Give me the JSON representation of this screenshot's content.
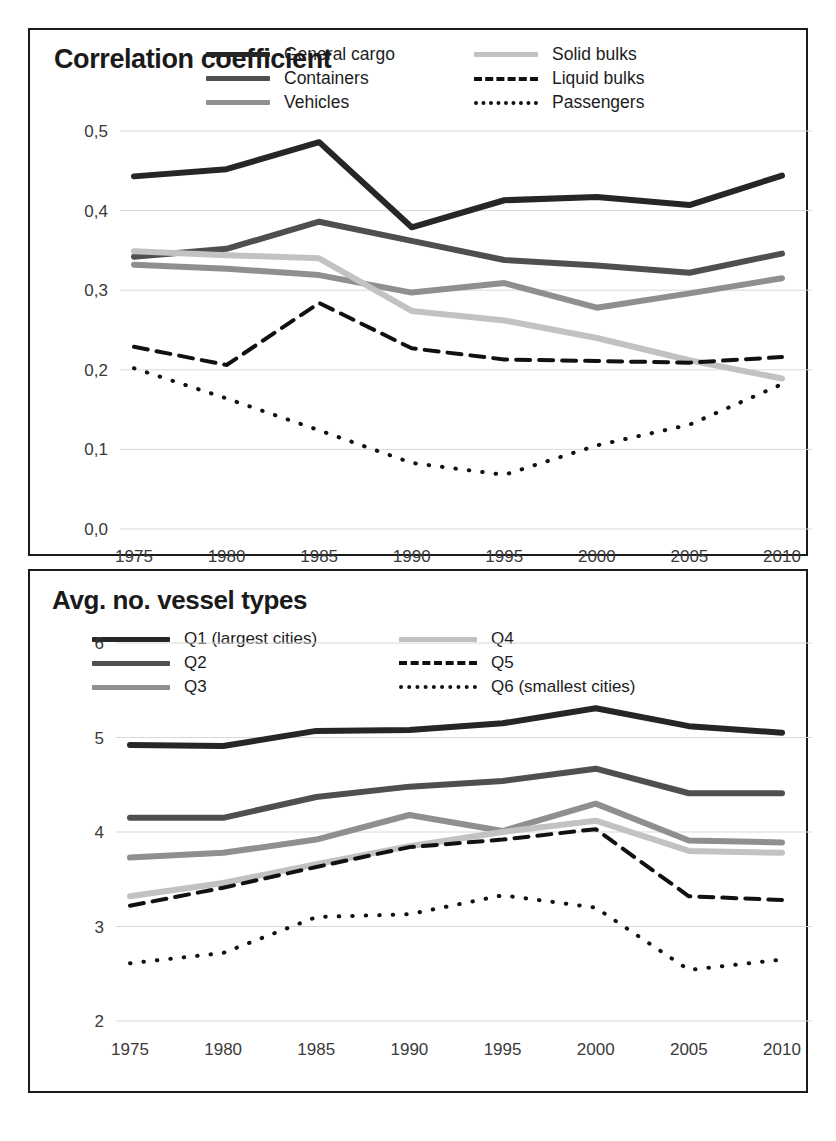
{
  "figure": {
    "background": "#ffffff",
    "frame_color": "#1b1b1b"
  },
  "palette": {
    "series1": "#262626",
    "series2": "#4f4f4f",
    "series3": "#8f8f8f",
    "series4": "#c2c2c2",
    "dashed": "#111111",
    "dotted": "#111111",
    "gridline": "#d9d9d9",
    "axis_text": "#3a3a3a"
  },
  "panels": [
    {
      "id": "top",
      "title": "Correlation coefficient",
      "legend": [
        {
          "label": "General cargo",
          "style": "solid",
          "color": "#262626",
          "width": 6
        },
        {
          "label": "Solid bulks",
          "style": "solid",
          "color": "#c2c2c2",
          "width": 6
        },
        {
          "label": "Containers",
          "style": "solid",
          "color": "#4f4f4f",
          "width": 6
        },
        {
          "label": "Liquid bulks",
          "style": "dashed",
          "color": "#111111",
          "width": 4
        },
        {
          "label": "Vehicles",
          "style": "solid",
          "color": "#8f8f8f",
          "width": 6
        },
        {
          "label": "Passengers",
          "style": "dotted",
          "color": "#111111",
          "width": 4
        }
      ]
    },
    {
      "id": "bottom",
      "title": "Avg. no. vessel types",
      "legend": [
        {
          "label": "Q1 (largest cities)",
          "style": "solid",
          "color": "#262626",
          "width": 6
        },
        {
          "label": "Q4",
          "style": "solid",
          "color": "#c2c2c2",
          "width": 6
        },
        {
          "label": "Q2",
          "style": "solid",
          "color": "#4f4f4f",
          "width": 6
        },
        {
          "label": "Q5",
          "style": "dashed",
          "color": "#111111",
          "width": 4
        },
        {
          "label": "Q3",
          "style": "solid",
          "color": "#8f8f8f",
          "width": 6
        },
        {
          "label": "Q6 (smallest cities)",
          "style": "dotted",
          "color": "#111111",
          "width": 4
        }
      ]
    }
  ],
  "chart_data": [
    {
      "type": "line",
      "title": "Correlation coefficient",
      "xlabel": "",
      "ylabel": "Correlation coefficient",
      "categories": [
        "1975",
        "1980",
        "1985",
        "1990",
        "1995",
        "2000",
        "2005",
        "2010"
      ],
      "x": [
        1975,
        1980,
        1985,
        1990,
        1995,
        2000,
        2005,
        2010
      ],
      "ylim": [
        0.0,
        0.5
      ],
      "yticks": [
        0.0,
        0.1,
        0.2,
        0.3,
        0.4,
        0.5
      ],
      "ytick_labels": [
        "0,0",
        "0,1",
        "0,2",
        "0,3",
        "0,4",
        "0,5"
      ],
      "grid": true,
      "legend_position": "top-right",
      "series": [
        {
          "name": "General cargo",
          "style": "solid",
          "color": "#262626",
          "width": 6,
          "values": [
            0.443,
            0.452,
            0.486,
            0.379,
            0.413,
            0.417,
            0.407,
            0.444
          ]
        },
        {
          "name": "Containers",
          "style": "solid",
          "color": "#4f4f4f",
          "width": 6,
          "values": [
            0.342,
            0.352,
            0.386,
            0.362,
            0.338,
            0.331,
            0.322,
            0.346
          ]
        },
        {
          "name": "Vehicles",
          "style": "solid",
          "color": "#8f8f8f",
          "width": 6,
          "values": [
            0.332,
            0.327,
            0.319,
            0.297,
            0.309,
            0.278,
            0.296,
            0.315
          ]
        },
        {
          "name": "Solid bulks",
          "style": "solid",
          "color": "#c2c2c2",
          "width": 6,
          "values": [
            0.349,
            0.344,
            0.34,
            0.274,
            0.262,
            0.24,
            0.212,
            0.189
          ]
        },
        {
          "name": "Liquid bulks",
          "style": "dashed",
          "color": "#111111",
          "width": 4,
          "values": [
            0.229,
            0.206,
            0.284,
            0.227,
            0.213,
            0.211,
            0.209,
            0.216
          ]
        },
        {
          "name": "Passengers",
          "style": "dotted",
          "color": "#111111",
          "width": 4,
          "values": [
            0.202,
            0.164,
            0.124,
            0.083,
            0.068,
            0.105,
            0.131,
            0.182
          ]
        }
      ]
    },
    {
      "type": "line",
      "title": "Avg. no. vessel types",
      "xlabel": "",
      "ylabel": "Avg. no. vessel types",
      "categories": [
        "1975",
        "1980",
        "1985",
        "1990",
        "1995",
        "2000",
        "2005",
        "2010"
      ],
      "x": [
        1975,
        1980,
        1985,
        1990,
        1995,
        2000,
        2005,
        2010
      ],
      "ylim": [
        2,
        6
      ],
      "yticks": [
        2,
        3,
        4,
        5,
        6
      ],
      "ytick_labels": [
        "2",
        "3",
        "4",
        "5",
        "6"
      ],
      "grid": true,
      "legend_position": "top-left",
      "series": [
        {
          "name": "Q1 (largest cities)",
          "style": "solid",
          "color": "#262626",
          "width": 6,
          "values": [
            4.92,
            4.91,
            5.07,
            5.08,
            5.15,
            5.31,
            5.12,
            5.05
          ]
        },
        {
          "name": "Q2",
          "style": "solid",
          "color": "#4f4f4f",
          "width": 6,
          "values": [
            4.15,
            4.15,
            4.37,
            4.48,
            4.54,
            4.67,
            4.41,
            4.41
          ]
        },
        {
          "name": "Q3",
          "style": "solid",
          "color": "#8f8f8f",
          "width": 6,
          "values": [
            3.73,
            3.78,
            3.92,
            4.18,
            4.01,
            4.3,
            3.91,
            3.89
          ]
        },
        {
          "name": "Q4",
          "style": "solid",
          "color": "#c2c2c2",
          "width": 6,
          "values": [
            3.32,
            3.46,
            3.66,
            3.85,
            4.0,
            4.12,
            3.8,
            3.78
          ]
        },
        {
          "name": "Q5",
          "style": "dashed",
          "color": "#111111",
          "width": 4,
          "values": [
            3.22,
            3.41,
            3.63,
            3.84,
            3.92,
            4.03,
            3.32,
            3.28
          ]
        },
        {
          "name": "Q6 (smallest cities)",
          "style": "dotted",
          "color": "#111111",
          "width": 4,
          "values": [
            2.61,
            2.72,
            3.1,
            3.13,
            3.33,
            3.2,
            2.54,
            2.65
          ]
        }
      ]
    }
  ],
  "caption": {
    "text": ""
  }
}
